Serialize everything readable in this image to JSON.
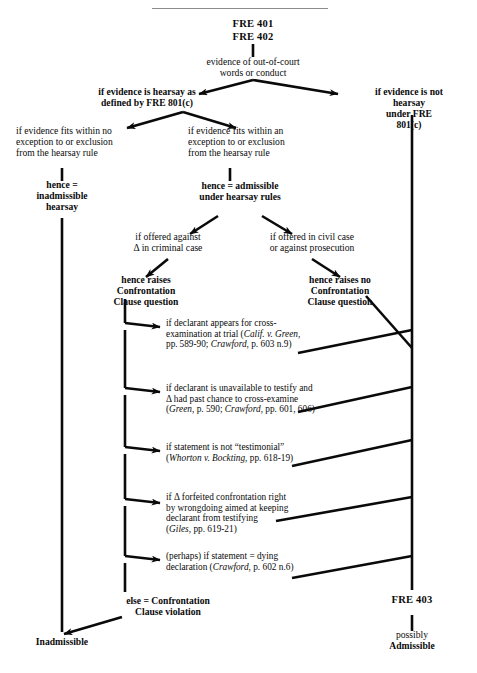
{
  "nodes": {
    "fre401": "FRE 401",
    "fre402": "FRE 402",
    "evidence_root": "evidence of out-of-court\nwords or conduct",
    "is_hearsay": "if evidence is hearsay as\ndefined by FRE 801(c)",
    "not_hearsay": "if evidence is not hearsay\nunder FRE 801(c)",
    "no_exception": "if evidence fits within no\nexception to or exclusion\nfrom the hearsay rule",
    "an_exception": "if evidence fits within an\nexception to or exclusion\nfrom the hearsay rule",
    "inadmissible_hearsay": "hence =\ninadmissible\nhearsay",
    "admissible_hearsay": "hence = admissible\nunder hearsay rules",
    "offered_against_d": "if offered against\nΔ in criminal case",
    "offered_civil": "if offered in civil case\nor against prosecution",
    "raises_cc": "hence raises\nConfrontation\nClause question",
    "raises_no_cc": "hence raises no\nConfrontation\nClause question",
    "else_violation": "else = Confrontation\nClause violation",
    "fre403": "FRE 403",
    "inadmissible": "Inadmissible",
    "possibly_admissible": "possibly\nAdmissible"
  },
  "conditions": [
    {
      "id": "cond-cross-exam-at-trial",
      "lines": [
        [
          {
            "t": "if declarant appears for cross-",
            "i": false
          }
        ],
        [
          {
            "t": "examination at trial (",
            "i": false
          },
          {
            "t": "Calif. v. Green",
            "i": true
          },
          {
            "t": ",",
            "i": false
          }
        ],
        [
          {
            "t": "pp. 589-90; ",
            "i": false
          },
          {
            "t": "Crawford",
            "i": true
          },
          {
            "t": ", p. 603 n.9)",
            "i": false
          }
        ]
      ]
    },
    {
      "id": "cond-unavailable-prior-cross",
      "lines": [
        [
          {
            "t": "if declarant is unavailable to testify and",
            "i": false
          }
        ],
        [
          {
            "t": "Δ had past chance to cross-examine",
            "i": false
          }
        ],
        [
          {
            "t": "(",
            "i": false
          },
          {
            "t": "Green",
            "i": true
          },
          {
            "t": ", p. 590; ",
            "i": false
          },
          {
            "t": "Crawford",
            "i": true
          },
          {
            "t": ", pp. 601, 606)",
            "i": false
          }
        ]
      ]
    },
    {
      "id": "cond-not-testimonial",
      "lines": [
        [
          {
            "t": "if statement is not “testimonial”",
            "i": false
          }
        ],
        [
          {
            "t": "(",
            "i": false
          },
          {
            "t": "Whorton v. Bockting",
            "i": true
          },
          {
            "t": ", pp. 618-19)",
            "i": false
          }
        ]
      ]
    },
    {
      "id": "cond-forfeiture-by-wrongdoing",
      "lines": [
        [
          {
            "t": "if Δ forfeited confrontation right",
            "i": false
          }
        ],
        [
          {
            "t": "by wrongdoing aimed at keeping",
            "i": false
          }
        ],
        [
          {
            "t": "declarant from testifying",
            "i": false
          }
        ],
        [
          {
            "t": "(",
            "i": false
          },
          {
            "t": "Giles",
            "i": true
          },
          {
            "t": ", pp. 619-21)",
            "i": false
          }
        ]
      ]
    },
    {
      "id": "cond-dying-declaration",
      "lines": [
        [
          {
            "t": "(perhaps) if statement = dying",
            "i": false
          }
        ],
        [
          {
            "t": "declaration (",
            "i": false
          },
          {
            "t": "Crawford",
            "i": true
          },
          {
            "t": ", p. 602 n.6)",
            "i": false
          }
        ]
      ]
    }
  ],
  "colors": {
    "ink": "#0a0a0a",
    "rule": "#8b8b8b",
    "page": "#ffffff"
  }
}
